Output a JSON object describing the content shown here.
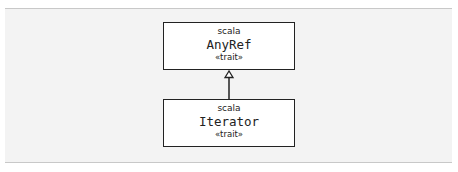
{
  "diagram": {
    "nodes": [
      {
        "id": "anyref",
        "package": "scala",
        "name": "AnyRef",
        "stereotype": "«trait»"
      },
      {
        "id": "iterator",
        "package": "scala",
        "name": "Iterator",
        "stereotype": "«trait»"
      }
    ],
    "edges": [
      {
        "from": "iterator",
        "to": "anyref",
        "type": "inheritance"
      }
    ]
  }
}
